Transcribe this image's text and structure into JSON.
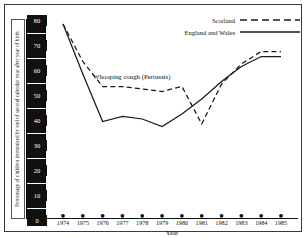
{
  "chart_data": {
    "type": "line",
    "title": "",
    "annotation": "Whooping cough (Pertussis)",
    "xlabel": "Year",
    "ylabel": "Percentage of children immunised by end of second calendar year after year of birth",
    "x": [
      1974,
      1975,
      1976,
      1977,
      1978,
      1979,
      1980,
      1981,
      1982,
      1983,
      1984,
      1985
    ],
    "categories": [
      "1974",
      "1975",
      "1976",
      "1977",
      "1978",
      "1979",
      "1980",
      "1981",
      "1982",
      "1983",
      "1984",
      "1985"
    ],
    "xlim": [
      1974,
      1985
    ],
    "ylim": [
      0,
      80
    ],
    "yticks": [
      0,
      10,
      20,
      30,
      40,
      50,
      60,
      70,
      80
    ],
    "ytick_labels": [
      "0",
      "10",
      "20",
      "30",
      "40",
      "50",
      "60",
      "70",
      "80"
    ],
    "grid": false,
    "legend_position": "top-right",
    "series": [
      {
        "name": "Scotland",
        "style": "dashed",
        "color": "#1a1a1a",
        "values": [
          78,
          63,
          53,
          53,
          52,
          51,
          53,
          38,
          54,
          62,
          67,
          67
        ]
      },
      {
        "name": "England and Wales",
        "style": "solid",
        "color": "#1a1a1a",
        "values": [
          78,
          58,
          39,
          41,
          40,
          37,
          42,
          48,
          55,
          61,
          65,
          65
        ]
      }
    ]
  },
  "legend": {
    "items": [
      {
        "label": "Scotland",
        "style": "dashed"
      },
      {
        "label": "England and Wales",
        "style": "solid"
      }
    ]
  },
  "axis": {
    "y_title": "Percentage of children immunised by end of second calendar year after year of birth",
    "x_title": "Year"
  }
}
